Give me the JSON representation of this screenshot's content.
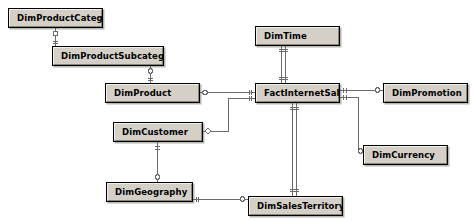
{
  "diagram": {
    "type": "entity-relationship-diagram",
    "canvas": {
      "width": 474,
      "height": 223,
      "background": "#ffffff"
    },
    "style": {
      "entity_fill": "#d4d0c8",
      "entity_border": "#000000",
      "connector_color": "#6b6b6b",
      "text_color": "#000000"
    },
    "entities": [
      {
        "id": "dimProductCategory",
        "label": "DimProductCategory",
        "x": 8,
        "y": 8,
        "w": 95,
        "h": 20
      },
      {
        "id": "dimProductSubcategory",
        "label": "DimProductSubcategory",
        "x": 52,
        "y": 46,
        "w": 112,
        "h": 20
      },
      {
        "id": "dimProduct",
        "label": "DimProduct",
        "x": 105,
        "y": 83,
        "w": 95,
        "h": 20
      },
      {
        "id": "dimTime",
        "label": "DimTime",
        "x": 255,
        "y": 26,
        "w": 85,
        "h": 20
      },
      {
        "id": "factInternetSales",
        "label": "FactInternetSales",
        "x": 255,
        "y": 83,
        "w": 85,
        "h": 20
      },
      {
        "id": "dimPromotion",
        "label": "DimPromotion",
        "x": 383,
        "y": 83,
        "w": 85,
        "h": 20
      },
      {
        "id": "dimCurrency",
        "label": "DimCurrency",
        "x": 363,
        "y": 145,
        "w": 85,
        "h": 20
      },
      {
        "id": "dimCustomer",
        "label": "DimCustomer",
        "x": 113,
        "y": 122,
        "w": 90,
        "h": 20
      },
      {
        "id": "dimGeography",
        "label": "DimGeography",
        "x": 106,
        "y": 182,
        "w": 87,
        "h": 20
      },
      {
        "id": "dimSalesTerritory",
        "label": "DimSalesTerritory",
        "x": 248,
        "y": 196,
        "w": 95,
        "h": 20
      }
    ],
    "relationships": [
      {
        "id": "rel-category-subcategory",
        "from": "dimProductCategory",
        "to": "dimProductSubcategory",
        "cardinality": "one-to-many"
      },
      {
        "id": "rel-subcategory-product",
        "from": "dimProductSubcategory",
        "to": "dimProduct",
        "cardinality": "one-to-many"
      },
      {
        "id": "rel-product-fact",
        "from": "dimProduct",
        "to": "factInternetSales",
        "cardinality": "one-to-many"
      },
      {
        "id": "rel-time-fact",
        "from": "dimTime",
        "to": "factInternetSales",
        "cardinality": "one-to-many"
      },
      {
        "id": "rel-fact-promotion",
        "from": "factInternetSales",
        "to": "dimPromotion",
        "cardinality": "many-to-one"
      },
      {
        "id": "rel-fact-currency",
        "from": "factInternetSales",
        "to": "dimCurrency",
        "cardinality": "many-to-one"
      },
      {
        "id": "rel-customer-fact",
        "from": "dimCustomer",
        "to": "factInternetSales",
        "cardinality": "one-to-many"
      },
      {
        "id": "rel-geography-customer",
        "from": "dimGeography",
        "to": "dimCustomer",
        "cardinality": "one-to-many"
      },
      {
        "id": "rel-geography-territory",
        "from": "dimGeography",
        "to": "dimSalesTerritory",
        "cardinality": "many-to-one"
      },
      {
        "id": "rel-fact-salesterritory",
        "from": "factInternetSales",
        "to": "dimSalesTerritory",
        "cardinality": "many-to-one"
      }
    ]
  }
}
